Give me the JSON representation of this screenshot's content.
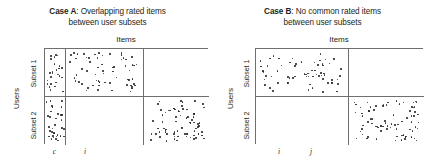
{
  "figure": {
    "dot_color": "#2b2b2b",
    "border_color": "#6f6f6f",
    "background": "#ffffff"
  },
  "panels": [
    {
      "id": "case-a",
      "title_case": "Case A",
      "title_rest": ": Overlapping rated items",
      "title_line2": "between user subsets",
      "items_label": "Items",
      "users_label": "Users",
      "row_labels": [
        "Subset 1",
        "Subset 2"
      ],
      "col_ticks": [
        "c",
        "i"
      ],
      "columns": 3,
      "rows": 2,
      "filled_cells": [
        {
          "row": 0,
          "col": 0,
          "count": 26
        },
        {
          "row": 0,
          "col": 1,
          "count": 62
        },
        {
          "row": 0,
          "col": 2,
          "count": 0
        },
        {
          "row": 1,
          "col": 0,
          "count": 34
        },
        {
          "row": 1,
          "col": 1,
          "count": 0
        },
        {
          "row": 1,
          "col": 2,
          "count": 74
        }
      ]
    },
    {
      "id": "case-b",
      "title_case": "Case B",
      "title_rest": ": No common rated items",
      "title_line2": "between user subsets",
      "items_label": "Items",
      "users_label": "Users",
      "row_labels": [
        "Subset 1",
        "Subset 2"
      ],
      "col_ticks": [
        "i",
        "j"
      ],
      "columns": 2,
      "rows": 2,
      "filled_cells": [
        {
          "row": 0,
          "col": 0,
          "count": 66
        },
        {
          "row": 0,
          "col": 1,
          "count": 0
        },
        {
          "row": 1,
          "col": 0,
          "count": 0
        },
        {
          "row": 1,
          "col": 1,
          "count": 78
        }
      ]
    }
  ]
}
